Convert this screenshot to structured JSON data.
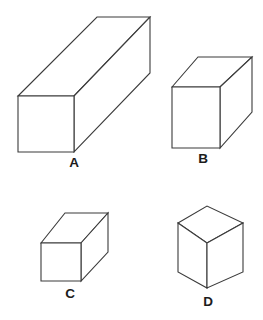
{
  "figure": {
    "background_color": "#ffffff",
    "stroke_color": "#3b3b3b",
    "label_color": "#1c1c1c",
    "shapes": [
      {
        "id": "shape-a",
        "label": "A",
        "description": "long rectangular prism",
        "projection": "oblique",
        "label_x": 74,
        "label_y": 167,
        "front_face": "18,96 74,96 74,152 18,152",
        "top_face": "18,96 97,17 150,17 74,96",
        "right_face": "74,96 150,17 150,73 74,152"
      },
      {
        "id": "shape-b",
        "label": "B",
        "description": "medium rectangular prism",
        "projection": "oblique",
        "label_x": 203,
        "label_y": 163,
        "front_face": "172,87 220,87 220,148 172,148",
        "top_face": "172,87 198,57 252,57 220,87",
        "right_face": "220,87 252,57 252,112 220,148"
      },
      {
        "id": "shape-c",
        "label": "C",
        "description": "short rectangular prism",
        "projection": "oblique",
        "label_x": 70,
        "label_y": 298,
        "front_face": "41,243 81,243 81,281 41,281",
        "top_face": "41,243 65,213 108,213 81,243",
        "right_face": "81,243 108,213 108,252 81,281"
      },
      {
        "id": "shape-d",
        "label": "D",
        "description": "cube in isometric view",
        "projection": "isometric",
        "label_x": 208,
        "label_y": 306,
        "top_face": "178,223 207,206 243,223 207,243",
        "left_face": "178,223 207,243 207,288 178,272",
        "right_face": "207,243 243,223 243,272 207,288"
      }
    ]
  }
}
